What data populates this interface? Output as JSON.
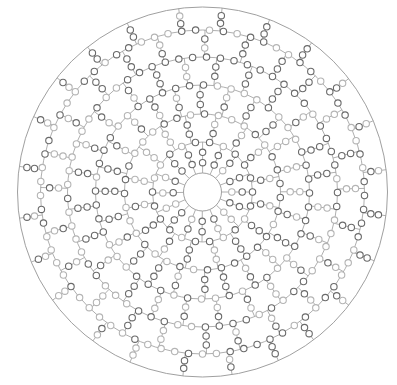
{
  "diagram": {
    "type": "polar-bead-grid",
    "center": {
      "x": 202.5,
      "y": 192
    },
    "outer_radius": 185,
    "inner_radius": 19,
    "ring_radii": [
      50,
      78,
      107,
      135,
      162
    ],
    "spoke_count": 24,
    "bead_radius": 3.2,
    "beads_per_segment": 2,
    "colors": {
      "line": "#9a9a9a",
      "outer_circle": "#a0a0a0",
      "bead_dark": "#6a6a6a",
      "bead_light": "#b4b4b4",
      "bead_fill": "#ffffff"
    }
  },
  "footer": {
    "text": ""
  }
}
